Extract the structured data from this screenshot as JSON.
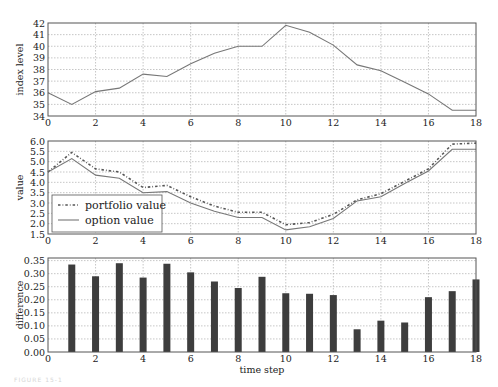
{
  "chart_data": [
    {
      "type": "line",
      "title": "",
      "xlabel": "",
      "ylabel": "index level",
      "xlim": [
        0,
        18
      ],
      "ylim": [
        34,
        42
      ],
      "grid": true,
      "xticks": [
        0,
        2,
        4,
        6,
        8,
        10,
        12,
        14,
        16,
        18
      ],
      "yticks": [
        34,
        35,
        36,
        37,
        38,
        39,
        40,
        41,
        42
      ],
      "x": [
        0,
        1,
        2,
        3,
        4,
        5,
        6,
        7,
        8,
        9,
        10,
        11,
        12,
        13,
        14,
        15,
        16,
        17,
        18
      ],
      "series": [
        {
          "name": "index level",
          "style": "solid",
          "color": "#777777",
          "values": [
            36.0,
            35.0,
            36.1,
            36.4,
            37.6,
            37.4,
            38.5,
            39.4,
            40.0,
            40.0,
            41.8,
            41.2,
            40.1,
            38.4,
            37.9,
            36.9,
            35.9,
            34.5,
            34.5
          ]
        }
      ]
    },
    {
      "type": "line",
      "title": "",
      "xlabel": "",
      "ylabel": "value",
      "xlim": [
        0,
        18
      ],
      "ylim": [
        1.5,
        6.0
      ],
      "grid": true,
      "xticks": [
        0,
        2,
        4,
        6,
        8,
        10,
        12,
        14,
        16,
        18
      ],
      "yticks": [
        1.5,
        2.0,
        2.5,
        3.0,
        3.5,
        4.0,
        4.5,
        5.0,
        5.5,
        6.0
      ],
      "legend_position": "lower left",
      "x": [
        0,
        1,
        2,
        3,
        4,
        5,
        6,
        7,
        8,
        9,
        10,
        11,
        12,
        13,
        14,
        15,
        16,
        17,
        18
      ],
      "series": [
        {
          "name": "portfolio value",
          "style": "dashdot",
          "color": "#666666",
          "values": [
            4.5,
            5.45,
            4.65,
            4.5,
            3.75,
            3.85,
            3.3,
            2.85,
            2.55,
            2.55,
            1.95,
            2.05,
            2.45,
            3.15,
            3.45,
            4.05,
            4.65,
            5.85,
            5.9
          ]
        },
        {
          "name": "option value",
          "style": "solid",
          "color": "#777777",
          "values": [
            4.5,
            5.15,
            4.35,
            4.2,
            3.5,
            3.55,
            3.0,
            2.6,
            2.3,
            2.3,
            1.7,
            1.85,
            2.25,
            3.1,
            3.3,
            3.95,
            4.55,
            5.6,
            5.6
          ]
        }
      ]
    },
    {
      "type": "bar",
      "title": "",
      "xlabel": "time step",
      "ylabel": "difference",
      "xlim": [
        0,
        18
      ],
      "ylim": [
        0.0,
        0.36
      ],
      "grid": true,
      "xticks": [
        0,
        2,
        4,
        6,
        8,
        10,
        12,
        14,
        16,
        18
      ],
      "yticks": [
        0.0,
        0.05,
        0.1,
        0.15,
        0.2,
        0.25,
        0.3,
        0.35
      ],
      "categories": [
        1,
        2,
        3,
        4,
        5,
        6,
        7,
        8,
        9,
        10,
        11,
        12,
        13,
        14,
        15,
        16,
        17,
        18
      ],
      "values": [
        0.335,
        0.29,
        0.34,
        0.285,
        0.338,
        0.305,
        0.27,
        0.245,
        0.288,
        0.225,
        0.223,
        0.218,
        0.087,
        0.12,
        0.113,
        0.21,
        0.233,
        0.278
      ],
      "bar_color": "#3d3d3d"
    }
  ],
  "panels": {
    "top": {
      "ylabel": "index level"
    },
    "middle": {
      "ylabel": "value",
      "legend": [
        "portfolio value",
        "option value"
      ]
    },
    "bottom": {
      "ylabel": "difference",
      "xlabel": "time step"
    }
  },
  "caption": "FIGURE 15-1"
}
